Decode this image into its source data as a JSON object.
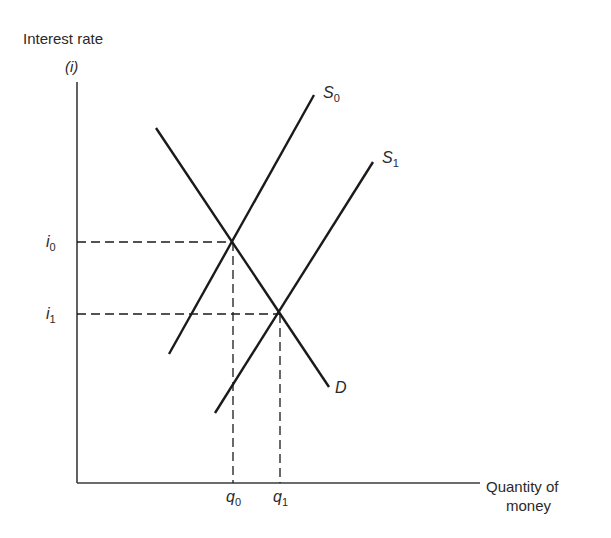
{
  "diagram": {
    "type": "supply-demand",
    "title": "",
    "y_axis": {
      "label": "Interest rate",
      "symbol": "(i)",
      "ticks": [
        {
          "base": "i",
          "sub": "0",
          "y": 242
        },
        {
          "base": "i",
          "sub": "1",
          "y": 314
        }
      ]
    },
    "x_axis": {
      "label_line1": "Quantity of",
      "label_line2": "money",
      "ticks": [
        {
          "base": "q",
          "sub": "0",
          "x": 233
        },
        {
          "base": "q",
          "sub": "1",
          "x": 280
        }
      ]
    },
    "curves": [
      {
        "name": "D",
        "base": "D",
        "sub": "",
        "from": [
          156,
          128
        ],
        "to": [
          329,
          387
        ]
      },
      {
        "name": "S0",
        "base": "S",
        "sub": "0",
        "from": [
          169,
          354
        ],
        "to": [
          314,
          95
        ]
      },
      {
        "name": "S1",
        "base": "S",
        "sub": "1",
        "from": [
          215,
          413
        ],
        "to": [
          373,
          162
        ]
      }
    ],
    "equilibria": [
      {
        "label": "E0",
        "x": 233,
        "y": 242
      },
      {
        "label": "E1",
        "x": 280,
        "y": 314
      }
    ],
    "colors": {
      "line": "#1a1a1a",
      "text": "#2a2a2a",
      "background": "#ffffff"
    }
  }
}
